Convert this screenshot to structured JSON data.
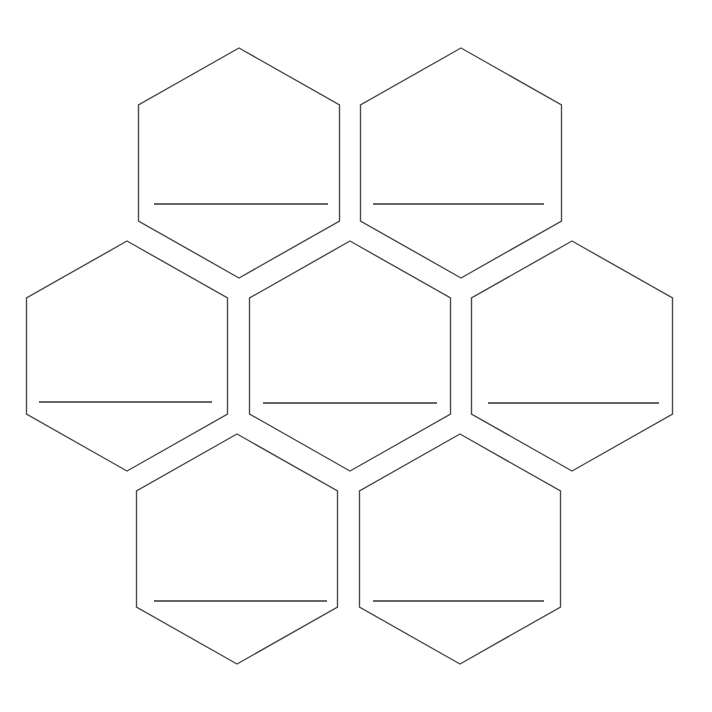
{
  "diagram": {
    "type": "honeycomb-worksheet",
    "background_color": "#ffffff",
    "stroke_color": "#4a4a4a",
    "line_color": "#333333",
    "hex_width": 201,
    "hex_height": 230,
    "hexagons": [
      {
        "id": "hex-1",
        "row": 1,
        "position": "top-left",
        "cx": 239,
        "top": 48,
        "label_line": {
          "y": 204,
          "x1": 154,
          "x2": 328
        },
        "label": ""
      },
      {
        "id": "hex-2",
        "row": 1,
        "position": "top-right",
        "cx": 461,
        "top": 48,
        "label_line": {
          "y": 204,
          "x1": 373,
          "x2": 544
        },
        "label": ""
      },
      {
        "id": "hex-3",
        "row": 2,
        "position": "middle-left",
        "cx": 127,
        "top": 241,
        "label_line": {
          "y": 402,
          "x1": 39,
          "x2": 212
        },
        "label": ""
      },
      {
        "id": "hex-4",
        "row": 2,
        "position": "middle-center",
        "cx": 350,
        "top": 241,
        "label_line": {
          "y": 403,
          "x1": 263,
          "x2": 437
        },
        "label": ""
      },
      {
        "id": "hex-5",
        "row": 2,
        "position": "middle-right",
        "cx": 572,
        "top": 241,
        "label_line": {
          "y": 403,
          "x1": 488,
          "x2": 659
        },
        "label": ""
      },
      {
        "id": "hex-6",
        "row": 3,
        "position": "bottom-left",
        "cx": 237,
        "top": 434,
        "label_line": {
          "y": 601,
          "x1": 154,
          "x2": 327
        },
        "label": ""
      },
      {
        "id": "hex-7",
        "row": 3,
        "position": "bottom-right",
        "cx": 460,
        "top": 434,
        "label_line": {
          "y": 601,
          "x1": 373,
          "x2": 544
        },
        "label": ""
      }
    ]
  }
}
